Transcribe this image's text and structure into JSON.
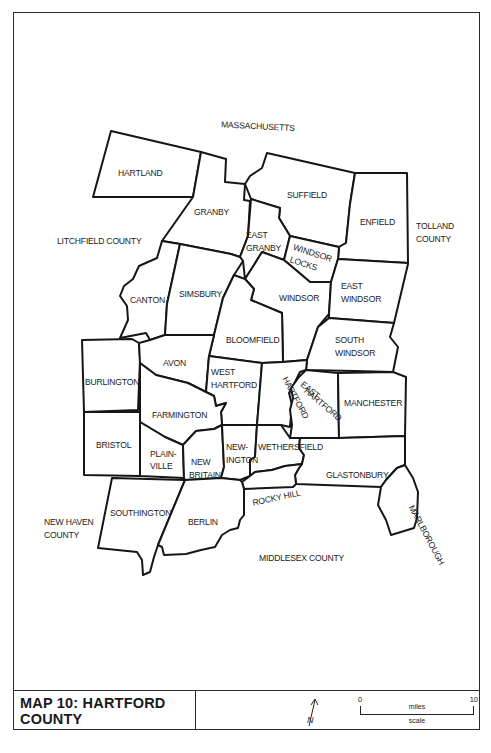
{
  "map": {
    "title_line1": "MAP 10:  HARTFORD",
    "title_line2": "COUNTY",
    "north_label": "N",
    "scale": {
      "start": "0",
      "end": "10",
      "units": "miles",
      "caption": "scale"
    },
    "neighbors": {
      "north": "MASSACHUSETTS",
      "west": "LITCHFIELD COUNTY",
      "east_line1": "TOLLAND",
      "east_line2": "COUNTY",
      "southwest_line1": "NEW HAVEN",
      "southwest_line2": "COUNTY",
      "south": "MIDDLESEX COUNTY"
    },
    "towns": {
      "hartland": "HARTLAND",
      "granby": "GRANBY",
      "suffield": "SUFFIELD",
      "enfield": "ENFIELD",
      "east_granby_1": "EAST",
      "east_granby_2": "GRANBY",
      "windsor_locks_1": "WINDSOR",
      "windsor_locks_2": "LOCKS",
      "canton": "CANTON",
      "simsbury": "SIMSBURY",
      "windsor": "WINDSOR",
      "east_windsor_1": "EAST",
      "east_windsor_2": "WINDSOR",
      "bloomfield": "BLOOMFIELD",
      "south_windsor_1": "SOUTH",
      "south_windsor_2": "WINDSOR",
      "burlington": "BURLINGTON",
      "avon": "AVON",
      "west_hartford_1": "WEST",
      "west_hartford_2": "HARTFORD",
      "hartford": "HARTFORD",
      "east_hartford_1": "EAST",
      "east_hartford_2": "HARTFORD",
      "manchester": "MANCHESTER",
      "farmington": "FARMINGTON",
      "bristol": "BRISTOL",
      "plainville_1": "PLAIN-",
      "plainville_2": "VILLE",
      "new_britain_1": "NEW",
      "new_britain_2": "BRITAIN",
      "newington_1": "NEW-",
      "newington_2": "INGTON",
      "wethersfield": "WETHERSFIELD",
      "glastonbury": "GLASTONBURY",
      "rocky_hill": "ROCKY HILL",
      "southington": "SOUTHINGTON",
      "berlin": "BERLIN",
      "marlborough": "MARLBOROUGH"
    }
  }
}
